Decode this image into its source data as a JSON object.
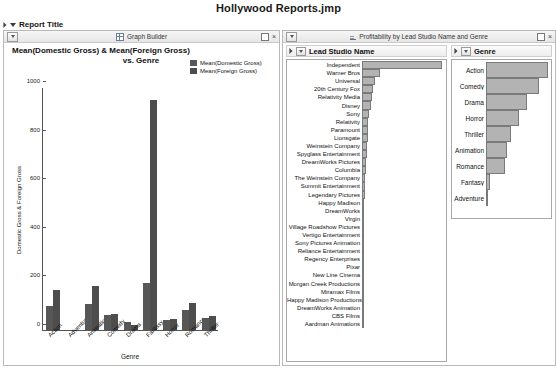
{
  "document": {
    "title": "Hollywood Reports.jmp"
  },
  "report": {
    "title": "Report Title",
    "expand_icon": "triangle-right-icon",
    "collapse_icon": "triangle-down-icon"
  },
  "graph_panel": {
    "titlebar": {
      "title": "Graph Builder",
      "icon": "graph-builder-icon",
      "menu_icon": "panel-menu-icon",
      "restore_label": "",
      "close_label": "×"
    },
    "heading_line1": "Mean(Domestic Gross) & Mean(Foreign Gross)",
    "heading_line2": "vs. Genre"
  },
  "prof_panel": {
    "titlebar": {
      "title": "Profitability by Lead Studio Name and Genre",
      "icon": "profitability-icon",
      "menu_icon": "panel-menu-icon",
      "restore_label": "",
      "close_label": "×"
    },
    "studio_section_title": "Lead Studio Name",
    "genre_section_title": "Genre"
  },
  "chart_data": [
    {
      "type": "bar",
      "id": "gross-by-genre",
      "title": "Mean(Domestic Gross) & Mean(Foreign Gross) vs. Genre",
      "xlabel": "Genre",
      "ylabel": "Domestic Gross & Foreign Gross",
      "ylim": [
        0,
        1000
      ],
      "yticks": [
        0,
        200,
        400,
        600,
        800,
        1000
      ],
      "grid": false,
      "legend_position": "top-right",
      "categories": [
        "Action",
        "Adventure",
        "Animation",
        "Comedy",
        "Drama",
        "Fantasy",
        "Horror",
        "Romance",
        "Thriller"
      ],
      "series": [
        {
          "name": "Mean(Domestic Gross)",
          "color": "#575757",
          "values": [
            98,
            0,
            108,
            62,
            32,
            194,
            42,
            82,
            48
          ]
        },
        {
          "name": "Mean(Foreign Gross)",
          "color": "#4d4d4d",
          "values": [
            163,
            0,
            182,
            66,
            20,
            945,
            47,
            110,
            57
          ]
        }
      ]
    },
    {
      "type": "bar",
      "id": "profitability-by-studio",
      "orientation": "horizontal",
      "title": "Lead Studio Name",
      "categories": [
        "Independent",
        "Warner Bros",
        "Universal",
        "20th Century Fox",
        "Relativity Media",
        "Disney",
        "Sony",
        "Relativity",
        "Paramount",
        "Lionsgate",
        "Weinstein Company",
        "Spyglass Entertainment",
        "DreamWorks Pictures",
        "Columbia",
        "The Weinstein Company",
        "Summit Entertainment",
        "Legendary Pictures",
        "Happy Madison",
        "DreamWorks",
        "Virgin",
        "Village Roadshow Pictures",
        "Vertigo Entertainment",
        "Sony Pictures Animation",
        "Reliance Entertainment",
        "Regency Enterprises",
        "Pixar",
        "New Line Cinema",
        "Morgan Creek Productions",
        "Miramax Films",
        "Happy Madison Productions",
        "DreamWorks Animation",
        "CBS Films",
        "Aardman Animations"
      ],
      "values": [
        100,
        23,
        16,
        14,
        12,
        11,
        9,
        8,
        8,
        7,
        6,
        6,
        5,
        5,
        4,
        4,
        4,
        3,
        3,
        3,
        3,
        3,
        2,
        2,
        2,
        2,
        2,
        2,
        2,
        2,
        2,
        2,
        2
      ],
      "bar_color": "#b3b3b3"
    },
    {
      "type": "bar",
      "id": "profitability-by-genre",
      "orientation": "horizontal",
      "title": "Genre",
      "categories": [
        "Action",
        "Comedy",
        "Drama",
        "Horror",
        "Thriller",
        "Animation",
        "Romance",
        "Fantasy",
        "Adventure"
      ],
      "values": [
        100,
        86,
        66,
        54,
        40,
        34,
        30,
        6,
        1
      ],
      "bar_color": "#b3b3b3"
    }
  ]
}
